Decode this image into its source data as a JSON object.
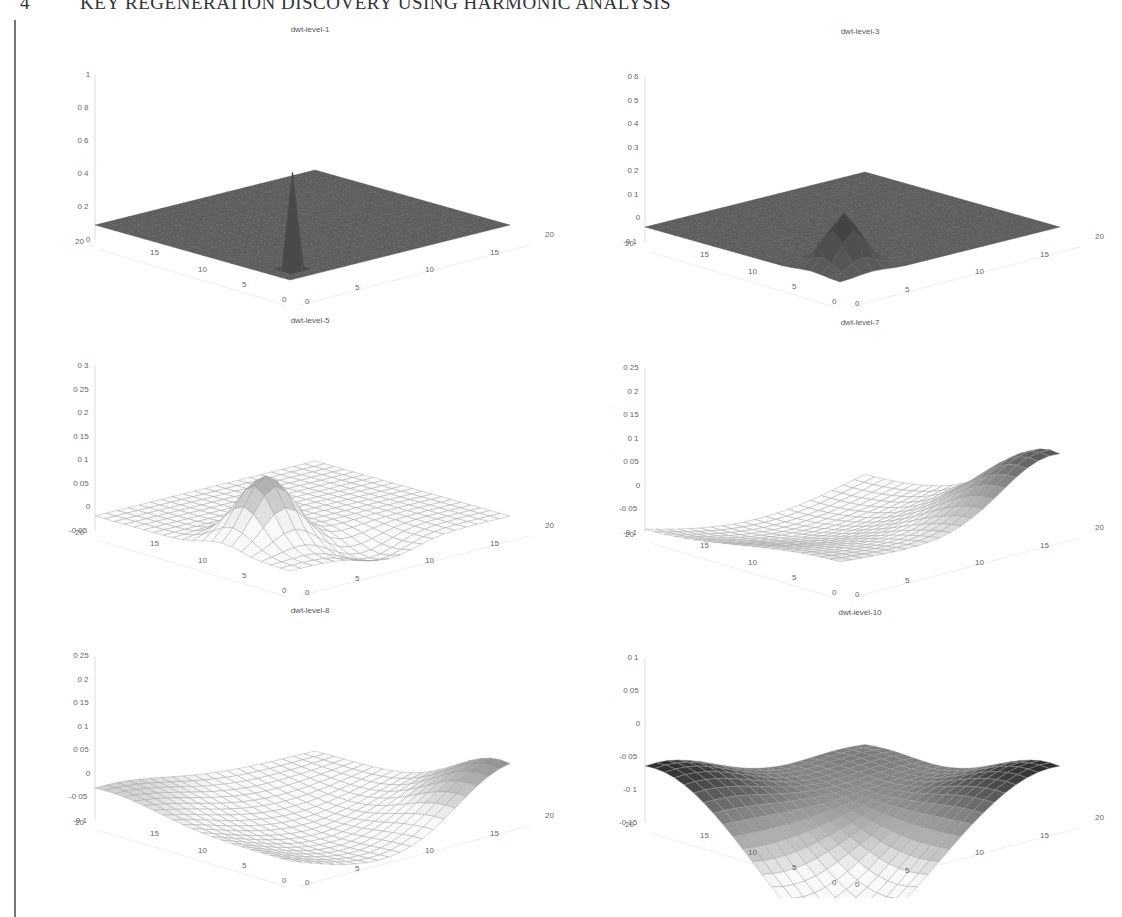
{
  "header": {
    "section_number": "4",
    "title": "KEY REGENERATION DISCOVERY USING HARMONIC ANALYSIS"
  },
  "chart_data": [
    {
      "type": "surface",
      "title": "dwt-level-1",
      "x_ticks": [
        0,
        5,
        10,
        15,
        20
      ],
      "y_ticks": [
        0,
        5,
        10,
        15,
        20
      ],
      "z_ticks": [
        "0",
        "0 2",
        "0 4",
        "0 6",
        "0 8",
        "1"
      ],
      "zlim": [
        0,
        1
      ],
      "peak": 0.6,
      "description": "flat plane with single sharp spike near (2,2)"
    },
    {
      "type": "surface",
      "title": "dwt-level-3",
      "x_ticks": [
        0,
        5,
        10,
        15,
        20
      ],
      "y_ticks": [
        0,
        5,
        10,
        15,
        20
      ],
      "z_ticks": [
        "-0 1",
        "0",
        "0 1",
        "0 2",
        "0 3",
        "0 4",
        "0 5",
        "0 6"
      ],
      "zlim": [
        -0.1,
        0.6
      ],
      "peak": 0.25,
      "description": "flat plane with narrow peak near origin corner"
    },
    {
      "type": "surface",
      "title": "dwt-level-5",
      "x_ticks": [
        0,
        5,
        10,
        15,
        20
      ],
      "y_ticks": [
        0,
        5,
        10,
        15,
        20
      ],
      "z_ticks": [
        "-0 05",
        "0",
        "0 05",
        "0 1",
        "0 15",
        "0 2",
        "0 25",
        "0 3"
      ],
      "zlim": [
        -0.05,
        0.3
      ],
      "peak": 0.15,
      "description": "broad bump with shallow trough"
    },
    {
      "type": "surface",
      "title": "dwt-level-7",
      "x_ticks": [
        0,
        5,
        10,
        15,
        20
      ],
      "y_ticks": [
        0,
        5,
        10,
        15,
        20
      ],
      "z_ticks": [
        "-0 1",
        "-0 05",
        "0",
        "0 05",
        "0 1",
        "0 15",
        "0 2",
        "0 25"
      ],
      "zlim": [
        -0.1,
        0.25
      ],
      "peak": 0.15,
      "description": "smooth saddle rising toward far right corner"
    },
    {
      "type": "surface",
      "title": "dwt-level-8",
      "x_ticks": [
        0,
        5,
        10,
        15,
        20
      ],
      "y_ticks": [
        0,
        5,
        10,
        15,
        20
      ],
      "z_ticks": [
        "-0 1",
        "-0 05",
        "0",
        "0 05",
        "0 1",
        "0 15",
        "0 2",
        "0 25"
      ],
      "zlim": [
        -0.1,
        0.25
      ],
      "peak": 0.12,
      "description": "smooth saddle with dip in front"
    },
    {
      "type": "surface",
      "title": "dwt-level-10",
      "x_ticks": [
        0,
        5,
        10,
        15,
        20
      ],
      "y_ticks": [
        0,
        5,
        10,
        15,
        20
      ],
      "z_ticks": [
        "-0 15",
        "-0 1",
        "-0 05",
        "0",
        "0 05",
        "0 1"
      ],
      "zlim": [
        -0.15,
        0.1
      ],
      "peak": 0.08,
      "description": "V-shaped surface with raised left and right corners"
    }
  ],
  "plots": [
    {
      "title": "dwt-level-1"
    },
    {
      "title": "dwt-level-3"
    },
    {
      "title": "dwt-level-5"
    },
    {
      "title": "dwt-level-7"
    },
    {
      "title": "dwt-level-8"
    },
    {
      "title": "dwt-level-10"
    }
  ]
}
